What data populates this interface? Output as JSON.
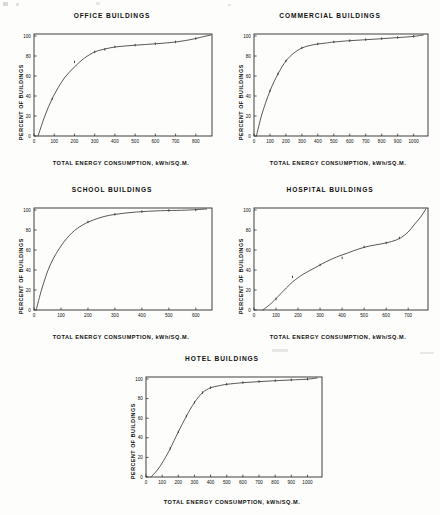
{
  "page": {
    "background_color": "#fdfdfb",
    "ink_color": "#101010",
    "axis_color": "#2a2a2a",
    "curve_color": "#3a3a3a"
  },
  "common": {
    "ylabel": "PERCENT OF BUILDINGS",
    "xlabel": "TOTAL ENERGY CONSUMPTION, kWh/SQ.M.",
    "ytick_labels": [
      "0",
      "20",
      "40",
      "60",
      "80",
      "100"
    ],
    "ytick_values": [
      0,
      20,
      40,
      60,
      80,
      100
    ]
  },
  "charts": [
    {
      "id": "office",
      "title": "OFFICE BUILDINGS",
      "xtick_labels": [
        "0",
        "100",
        "200",
        "300",
        "400",
        "500",
        "600",
        "700",
        "800"
      ]
    },
    {
      "id": "commercial",
      "title": "COMMERCIAL BUILDINGS",
      "xtick_labels": [
        "0",
        "100",
        "200",
        "300",
        "400",
        "500",
        "600",
        "700",
        "800",
        "900",
        "1000"
      ]
    },
    {
      "id": "school",
      "title": "SCHOOL BUILDINGS",
      "xtick_labels": [
        "0",
        "100",
        "200",
        "300",
        "400",
        "500",
        "600"
      ]
    },
    {
      "id": "hospital",
      "title": "HOSPITAL BUILDINGS",
      "xtick_labels": [
        "0",
        "100",
        "200",
        "300",
        "400",
        "500",
        "600",
        "700"
      ]
    },
    {
      "id": "hotel",
      "title": "HOTEL BUILDINGS",
      "xtick_labels": [
        "0",
        "100",
        "200",
        "300",
        "400",
        "500",
        "600",
        "700",
        "800",
        "900",
        "1000"
      ]
    }
  ],
  "chart_data": [
    {
      "type": "line",
      "id": "office",
      "title": "OFFICE BUILDINGS",
      "xlabel": "TOTAL ENERGY CONSUMPTION, kWh/SQ.M.",
      "ylabel": "PERCENT OF BUILDINGS",
      "xlim": [
        0,
        880
      ],
      "ylim": [
        0,
        102
      ],
      "xticks": [
        0,
        100,
        200,
        300,
        400,
        500,
        600,
        700,
        800
      ],
      "yticks": [
        0,
        20,
        40,
        60,
        80,
        100
      ],
      "grid": false,
      "legend": "none",
      "series": [
        {
          "name": "cumulative percent of office buildings",
          "x": [
            20,
            50,
            80,
            110,
            150,
            200,
            250,
            300,
            350,
            400,
            450,
            500,
            550,
            600,
            650,
            700,
            750,
            800,
            840,
            875
          ],
          "y": [
            0,
            18,
            33,
            45,
            58,
            69,
            78,
            84,
            87,
            89,
            90,
            90.8,
            91.5,
            92.2,
            93,
            94,
            95.5,
            97.5,
            99.5,
            101
          ]
        }
      ],
      "markers": {
        "x": [
          90,
          200,
          300,
          350,
          400,
          500,
          600,
          700,
          800
        ],
        "y": [
          37,
          74,
          84,
          86.5,
          89,
          90.8,
          92.2,
          94,
          97.5
        ]
      }
    },
    {
      "type": "line",
      "id": "commercial",
      "title": "COMMERCIAL BUILDINGS",
      "xlabel": "TOTAL ENERGY CONSUMPTION, kWh/SQ.M.",
      "ylabel": "PERCENT OF BUILDINGS",
      "xlim": [
        0,
        1090
      ],
      "ylim": [
        0,
        102
      ],
      "xticks": [
        0,
        100,
        200,
        300,
        400,
        500,
        600,
        700,
        800,
        900,
        1000
      ],
      "yticks": [
        0,
        20,
        40,
        60,
        80,
        100
      ],
      "grid": false,
      "legend": "none",
      "series": [
        {
          "name": "cumulative percent of commercial buildings",
          "x": [
            15,
            50,
            100,
            150,
            200,
            250,
            300,
            350,
            400,
            450,
            500,
            600,
            700,
            800,
            900,
            1000,
            1060
          ],
          "y": [
            0,
            22,
            45,
            62,
            75,
            83,
            88,
            90.5,
            92,
            93,
            94,
            95.3,
            96.3,
            97.3,
            98.4,
            99.6,
            101
          ]
        }
      ],
      "markers": {
        "x": [
          100,
          150,
          200,
          300,
          400,
          500,
          600,
          700,
          800,
          900,
          1000
        ],
        "y": [
          45,
          62,
          75,
          88,
          92,
          94,
          95.3,
          96.3,
          97.3,
          98.4,
          99.6
        ]
      }
    },
    {
      "type": "line",
      "id": "school",
      "title": "SCHOOL BUILDINGS",
      "xlabel": "TOTAL ENERGY CONSUMPTION, kWh/SQ.M.",
      "ylabel": "PERCENT OF BUILDINGS",
      "xlim": [
        0,
        660
      ],
      "ylim": [
        0,
        102
      ],
      "xticks": [
        0,
        100,
        200,
        300,
        400,
        500,
        600
      ],
      "yticks": [
        0,
        20,
        40,
        60,
        80,
        100
      ],
      "grid": false,
      "legend": "none",
      "series": [
        {
          "name": "cumulative percent of school buildings",
          "x": [
            8,
            30,
            60,
            100,
            140,
            180,
            220,
            260,
            300,
            340,
            380,
            420,
            460,
            500,
            560,
            640
          ],
          "y": [
            0,
            22,
            45,
            64,
            77,
            85,
            90,
            93.5,
            95.6,
            97,
            98,
            98.7,
            99.2,
            99.5,
            99.8,
            101
          ]
        }
      ],
      "markers": {
        "x": [
          200,
          300,
          400,
          500,
          600
        ],
        "y": [
          88,
          95.6,
          98.3,
          99.5,
          99.9
        ]
      }
    },
    {
      "type": "line",
      "id": "hospital",
      "title": "HOSPITAL BUILDINGS",
      "xlabel": "TOTAL ENERGY CONSUMPTION, kWh/SQ.M.",
      "ylabel": "PERCENT OF BUILDINGS",
      "xlim": [
        0,
        790
      ],
      "ylim": [
        0,
        102
      ],
      "xticks": [
        0,
        100,
        200,
        300,
        400,
        500,
        600,
        700
      ],
      "yticks": [
        0,
        20,
        40,
        60,
        80,
        100
      ],
      "grid": false,
      "legend": "none",
      "series": [
        {
          "name": "cumulative percent of hospital buildings",
          "x": [
            40,
            80,
            120,
            175,
            225,
            275,
            325,
            375,
            425,
            475,
            525,
            575,
            625,
            665,
            700,
            730,
            760,
            780
          ],
          "y": [
            0,
            7,
            16,
            28,
            36,
            42,
            48,
            53,
            57,
            61,
            64,
            66,
            68.5,
            72,
            78,
            86,
            94,
            101
          ]
        }
      ],
      "markers": {
        "x": [
          100,
          175,
          300,
          400,
          500,
          600,
          660
        ],
        "y": [
          11,
          33,
          45,
          52,
          63,
          67,
          72
        ]
      }
    },
    {
      "type": "line",
      "id": "hotel",
      "title": "HOTEL BUILDINGS",
      "xlabel": "TOTAL ENERGY CONSUMPTION, kWh/SQ.M.",
      "ylabel": "PERCENT OF BUILDINGS",
      "xlim": [
        0,
        1090
      ],
      "ylim": [
        0,
        102
      ],
      "xticks": [
        0,
        100,
        200,
        300,
        400,
        500,
        600,
        700,
        800,
        900,
        1000
      ],
      "yticks": [
        0,
        20,
        40,
        60,
        80,
        100
      ],
      "grid": false,
      "legend": "none",
      "series": [
        {
          "name": "cumulative percent of hotel buildings",
          "x": [
            30,
            70,
            110,
            150,
            200,
            250,
            300,
            350,
            400,
            450,
            500,
            600,
            700,
            800,
            900,
            1000,
            1060
          ],
          "y": [
            0,
            7,
            17,
            29,
            46,
            62,
            76,
            86,
            91,
            93,
            94.5,
            96.2,
            97.3,
            98.2,
            99,
            99.8,
            101
          ]
        }
      ],
      "markers": {
        "x": [
          150,
          200,
          250,
          300,
          350,
          400,
          500,
          600,
          700,
          800,
          900,
          1000
        ],
        "y": [
          29,
          46,
          62,
          76,
          86,
          91,
          94.5,
          96.2,
          97.3,
          98.2,
          99,
          99.8
        ]
      }
    }
  ]
}
